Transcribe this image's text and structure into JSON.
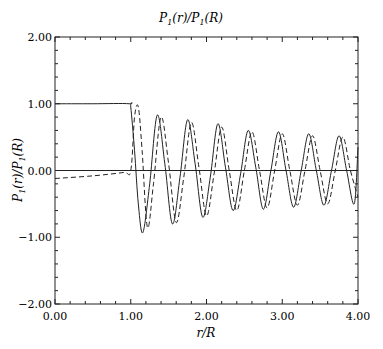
{
  "chart_data": {
    "type": "line",
    "title": "P1(r)/P1(R)",
    "xlabel": "r/R",
    "ylabel": "P1(r)/P1(R)",
    "xlim": [
      0,
      4
    ],
    "ylim": [
      -2,
      2
    ],
    "x_ticks": [
      "0.00",
      "1.00",
      "2.00",
      "3.00",
      "4.00"
    ],
    "y_ticks": [
      "2.00",
      "1.00",
      "0.00",
      "-1.00",
      "-2.00"
    ],
    "grid": false,
    "legend": "none",
    "series": [
      {
        "name": "solid",
        "style": "solid",
        "x": [
          0.0,
          0.5,
          0.98,
          1.0,
          1.05,
          1.1,
          1.16,
          1.25,
          1.35,
          1.45,
          1.55,
          1.65,
          1.75,
          1.85,
          1.95,
          2.05,
          2.15,
          2.25,
          2.35,
          2.45,
          2.55,
          2.65,
          2.75,
          2.85,
          2.95,
          3.05,
          3.15,
          3.25,
          3.35,
          3.45,
          3.55,
          3.65,
          3.75,
          3.85,
          3.95,
          4.0
        ],
        "y": [
          1.0,
          1.0,
          1.0,
          0.95,
          0.3,
          -0.5,
          -0.93,
          -0.2,
          0.83,
          0.1,
          -0.8,
          -0.1,
          0.76,
          0.1,
          -0.7,
          -0.1,
          0.7,
          0.05,
          -0.6,
          -0.05,
          0.6,
          0.05,
          -0.58,
          0.0,
          0.58,
          0.0,
          -0.55,
          0.0,
          0.55,
          0.0,
          -0.52,
          0.0,
          0.52,
          0.0,
          -0.5,
          0.35
        ]
      },
      {
        "name": "dashed",
        "style": "dashed",
        "x": [
          0.0,
          0.5,
          0.9,
          1.0,
          1.05,
          1.1,
          1.15,
          1.22,
          1.3,
          1.4,
          1.5,
          1.6,
          1.7,
          1.8,
          1.9,
          2.0,
          2.1,
          2.2,
          2.3,
          2.4,
          2.5,
          2.6,
          2.7,
          2.8,
          2.9,
          3.0,
          3.1,
          3.2,
          3.3,
          3.4,
          3.5,
          3.6,
          3.7,
          3.8,
          3.9,
          4.0
        ],
        "y": [
          -0.12,
          -0.08,
          -0.03,
          0.0,
          0.8,
          0.95,
          0.3,
          -0.85,
          -0.2,
          0.8,
          0.1,
          -0.78,
          -0.1,
          0.72,
          0.05,
          -0.68,
          -0.05,
          0.65,
          0.0,
          -0.6,
          0.0,
          0.58,
          0.0,
          -0.56,
          0.0,
          0.55,
          0.0,
          -0.52,
          0.0,
          0.52,
          0.0,
          -0.5,
          0.0,
          0.5,
          0.0,
          -0.4
        ]
      }
    ]
  },
  "labels": {
    "title_main": "P",
    "title_sub1": "1",
    "title_mid": "(r)/P",
    "title_sub2": "1",
    "title_end": "(R)",
    "xlabel": "r/R",
    "ylabel_main": "P",
    "ylabel_sub1": "1",
    "ylabel_mid": "(r)/P",
    "ylabel_sub2": "1",
    "ylabel_end": "(R)"
  }
}
